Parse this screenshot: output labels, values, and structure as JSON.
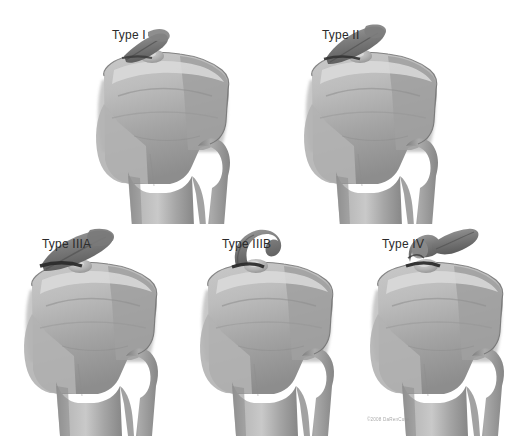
{
  "figure": {
    "background_color": "#ffffff",
    "label_color": "#2b2b2b",
    "bone_light": "#d2d2d2",
    "bone_mid": "#a8a8a8",
    "bone_dark": "#6f6f6f",
    "bone_outline": "#5a5a5a",
    "fragment_dark": "#6a6a6a",
    "panel_count": 5,
    "rows": 2
  },
  "panels": [
    {
      "id": "type-1",
      "label": "Type I",
      "row": 1,
      "column": 1,
      "label_x": 112,
      "label_y": 29,
      "bone_x": 88,
      "bone_y": 26,
      "bone_w": 152,
      "bone_h": 198,
      "fragment": "minimally displaced",
      "fragment_style": "flat"
    },
    {
      "id": "type-2",
      "label": "Type II",
      "row": 1,
      "column": 2,
      "label_x": 322,
      "label_y": 29,
      "bone_x": 296,
      "bone_y": 26,
      "bone_w": 152,
      "bone_h": 198,
      "fragment": "hinged anterior elevation",
      "fragment_style": "hinged"
    },
    {
      "id": "type-3a",
      "label": "Type IIIA",
      "row": 2,
      "column": 1,
      "label_x": 42,
      "label_y": 238,
      "bone_x": 18,
      "bone_y": 236,
      "bone_w": 152,
      "bone_h": 200,
      "fragment": "completely displaced",
      "fragment_style": "displaced"
    },
    {
      "id": "type-3b",
      "label": "Type IIIB",
      "row": 2,
      "column": 2,
      "label_x": 222,
      "label_y": 238,
      "bone_x": 196,
      "bone_y": 236,
      "bone_w": 152,
      "bone_h": 200,
      "fragment": "displaced and rotated",
      "fragment_style": "rotated"
    },
    {
      "id": "type-4",
      "label": "Type IV",
      "row": 2,
      "column": 3,
      "label_x": 382,
      "label_y": 238,
      "bone_x": 362,
      "bone_y": 236,
      "bone_w": 152,
      "bone_h": 200,
      "fragment": "comminuted",
      "fragment_style": "comminuted"
    }
  ],
  "watermark": {
    "text": "©2008 DaRenCure",
    "x": 367,
    "y": 416
  }
}
